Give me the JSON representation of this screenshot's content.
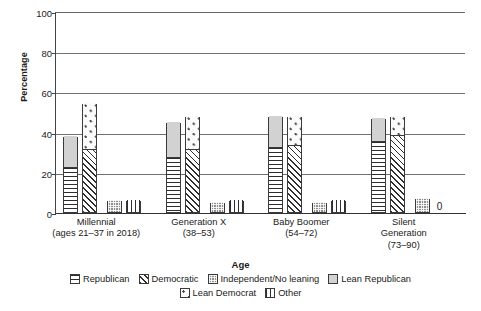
{
  "chart_data": {
    "type": "bar",
    "title": "",
    "xlabel": "Age",
    "ylabel": "Percentage",
    "ylim": [
      0,
      100
    ],
    "yticks": [
      0,
      20,
      40,
      60,
      80,
      100
    ],
    "grid": true,
    "legend_position": "bottom",
    "stacked_groups": true,
    "categories": [
      "Millennial\n(ages 21–37 in 2018)",
      "Generation X\n(38–53)",
      "Baby Boomer\n(54–72)",
      "Silent\nGeneration\n(73–90)"
    ],
    "category_lines": [
      [
        "Millennial",
        "(ages 21–37 in 2018)"
      ],
      [
        "Generation X",
        "(38–53)"
      ],
      [
        "Baby Boomer",
        "(54–72)"
      ],
      [
        "Silent",
        "Generation",
        "(73–90)"
      ]
    ],
    "series": [
      {
        "name": "Republican",
        "values": [
          22,
          27,
          32,
          35
        ]
      },
      {
        "name": "Lean Republican",
        "values": [
          16,
          18,
          16,
          12
        ]
      },
      {
        "name": "Democratic",
        "values": [
          31,
          31,
          33,
          38
        ]
      },
      {
        "name": "Lean Democrat",
        "values": [
          23,
          17,
          15,
          10
        ]
      },
      {
        "name": "Independent/No leaning",
        "values": [
          6,
          5,
          5,
          7
        ]
      },
      {
        "name": "Other",
        "values": [
          6,
          6,
          6,
          0
        ]
      }
    ],
    "bar_totals": {
      "republican_stack": [
        38,
        45,
        48,
        47
      ],
      "democratic_stack": [
        54,
        48,
        48,
        48
      ]
    },
    "annotations": [
      {
        "text": "0",
        "category": "Silent\nGeneration\n(73–90)",
        "series": "Other"
      }
    ]
  },
  "legend": {
    "row1": [
      {
        "label": "Republican",
        "pattern": "horizontal-lines"
      },
      {
        "label": "Democratic",
        "pattern": "diagonal-hatch"
      },
      {
        "label": "Independent/No leaning",
        "pattern": "cross-hatch-dark"
      },
      {
        "label": "Lean Republican",
        "pattern": "solid-light-gray"
      }
    ],
    "row2": [
      {
        "label": "Lean Democrat",
        "pattern": "dotted"
      },
      {
        "label": "Other",
        "pattern": "vertical-lines"
      }
    ]
  }
}
